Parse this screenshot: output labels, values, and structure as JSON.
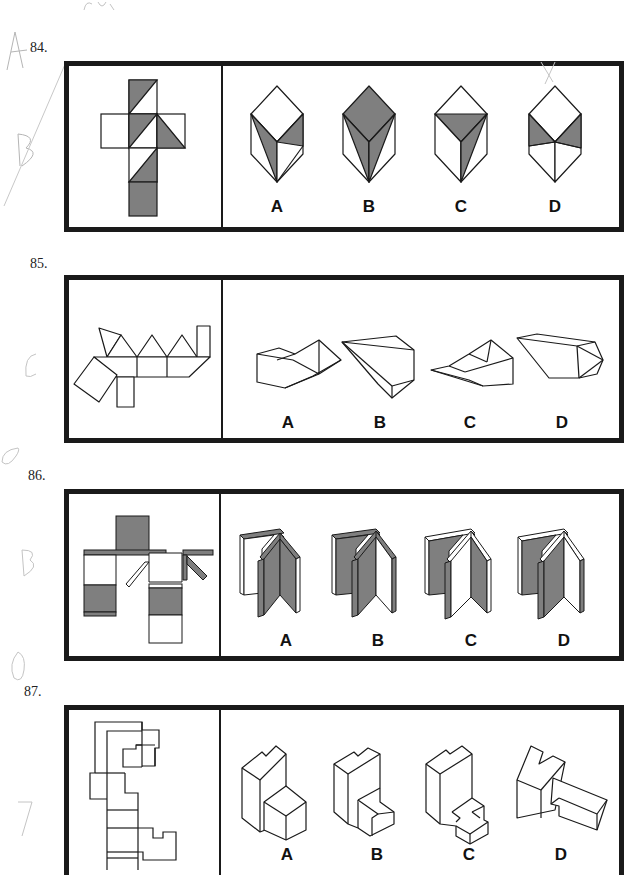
{
  "page": {
    "type": "spatial-reasoning test page (cube / solid net folding)",
    "handwriting_top": "scribble"
  },
  "questions": [
    {
      "number": "84.",
      "description": "Cube net with grey-shaded triangles; choose folded cube",
      "options": [
        "A",
        "B",
        "C",
        "D"
      ],
      "margin_marks": [
        "A",
        "B"
      ],
      "mark_on_option": "X"
    },
    {
      "number": "85.",
      "description": "Net with triangles, rectangles and parallelograms; choose folded solid",
      "options": [
        "A",
        "B",
        "C",
        "D"
      ],
      "margin_marks": [
        "C"
      ]
    },
    {
      "number": "86.",
      "description": "Net with shaded panels and diagonal strips; choose folded book-like shape",
      "options": [
        "A",
        "B",
        "C",
        "D"
      ],
      "margin_marks": [
        "O",
        "B"
      ]
    },
    {
      "number": "87.",
      "description": "Outline net of stepped block; choose folded solid",
      "options": [
        "A",
        "B",
        "C",
        "D"
      ],
      "margin_marks": [
        "O",
        "D"
      ]
    }
  ],
  "colors": {
    "shade": "#7f7f7f",
    "line": "#1a1a1a",
    "pencil": "#b5b5b5"
  }
}
